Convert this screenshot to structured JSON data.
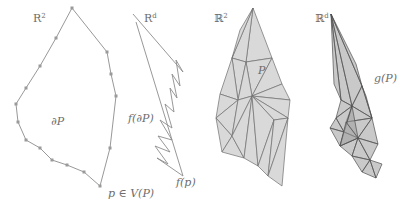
{
  "figure": {
    "background_color": "#ffffff",
    "outline_color": "#8c8c8c",
    "face_fill_color": "#d9d9d9",
    "image_face_fill_color": "#9c9c9c",
    "label_color": "#6d6d6d",
    "panels": [
      {
        "id": "panel-source-polygon",
        "space_label": "R",
        "space_exponent": "2",
        "space_style": "roman",
        "content_label": "∂P",
        "vertex_label": "p ∈ V(P)",
        "description": "simple closed polygon boundary with vertex markers"
      },
      {
        "id": "panel-boundary-image",
        "space_label": "R",
        "space_exponent": "d",
        "space_style": "roman",
        "content_label": "f(∂P)",
        "vertex_label": "f(p)",
        "description": "crumpled zigzag polyline image of the boundary"
      },
      {
        "id": "panel-triangulated-polygon",
        "space_label": "ℝ",
        "space_exponent": "2",
        "space_style": "blackboard",
        "content_label": "P",
        "description": "triangulated filled polygon"
      },
      {
        "id": "panel-polygon-image",
        "space_label": "ℝ",
        "space_exponent": "d",
        "space_style": "blackboard",
        "content_label": "g(P)",
        "description": "overlapping semi-transparent triangle image of the triangulation"
      }
    ]
  },
  "chart_data": {
    "type": "diagram",
    "title": "",
    "panel1_polygon_points": "72,8 107,52 111,74 116,96 110,148 100,186 84,172 67,165 52,160 40,148 26,140 18,122 16,104 26,88 40,66 56,38",
    "panel1_vertices": [
      [
        72,
        8
      ],
      [
        107,
        52
      ],
      [
        111,
        74
      ],
      [
        116,
        96
      ],
      [
        110,
        148
      ],
      [
        100,
        186
      ],
      [
        84,
        172
      ],
      [
        67,
        165
      ],
      [
        52,
        160
      ],
      [
        40,
        148
      ],
      [
        26,
        140
      ],
      [
        18,
        122
      ],
      [
        16,
        104
      ],
      [
        26,
        88
      ],
      [
        40,
        66
      ],
      [
        56,
        38
      ]
    ],
    "panel2_zigzag_points": "133,14 183,72 176,60 180,86 172,74 177,98 170,88 174,112 165,104 172,128 160,120 172,140 158,136 170,152 155,146 168,164 157,158 183,176 136,22",
    "panel3_faces": [
      {
        "points": "253,8 272,58 246,62"
      },
      {
        "points": "253,8 246,62 232,58"
      },
      {
        "points": "253,8 232,58 240,30"
      },
      {
        "points": "272,58 246,62 252,96"
      },
      {
        "points": "272,58 252,96 282,84"
      },
      {
        "points": "282,84 252,96 290,100"
      },
      {
        "points": "290,100 252,96 288,118"
      },
      {
        "points": "288,118 252,96 274,120"
      },
      {
        "points": "246,62 232,58 238,100"
      },
      {
        "points": "246,62 238,100 252,96"
      },
      {
        "points": "232,58 238,100 220,94"
      },
      {
        "points": "220,94 238,100 216,118"
      },
      {
        "points": "216,118 238,100 232,136"
      },
      {
        "points": "232,136 238,100 252,96"
      },
      {
        "points": "216,118 232,136 222,152"
      },
      {
        "points": "222,152 232,136 244,158"
      },
      {
        "points": "244,158 232,136 252,96"
      },
      {
        "points": "244,158 252,96 258,166"
      },
      {
        "points": "258,166 252,96 274,120"
      },
      {
        "points": "258,166 274,120 268,176"
      },
      {
        "points": "268,176 274,120 288,118"
      },
      {
        "points": "268,176 288,118 282,186"
      }
    ],
    "panel4_faces": [
      {
        "points": "331,14 352,106 341,100"
      },
      {
        "points": "331,14 341,100 334,84"
      },
      {
        "points": "331,14 352,106 362,86"
      },
      {
        "points": "331,14 362,86 356,64"
      },
      {
        "points": "352,106 362,86 372,118"
      },
      {
        "points": "352,106 372,118 346,122"
      },
      {
        "points": "346,122 372,118 358,138"
      },
      {
        "points": "358,138 372,118 378,144"
      },
      {
        "points": "341,100 352,106 336,118"
      },
      {
        "points": "336,118 352,106 344,132"
      },
      {
        "points": "344,132 352,106 358,138"
      },
      {
        "points": "336,118 344,132 330,128"
      },
      {
        "points": "330,128 344,132 340,146"
      },
      {
        "points": "340,146 344,132 358,138"
      },
      {
        "points": "340,146 358,138 352,156"
      },
      {
        "points": "352,156 358,138 370,160"
      },
      {
        "points": "370,160 358,138 378,144"
      },
      {
        "points": "352,156 370,160 362,172"
      },
      {
        "points": "362,172 370,160 376,178"
      },
      {
        "points": "370,160 376,178 382,164"
      },
      {
        "points": "346,122 358,138 340,146"
      },
      {
        "points": "362,86 372,118 366,96"
      }
    ]
  }
}
